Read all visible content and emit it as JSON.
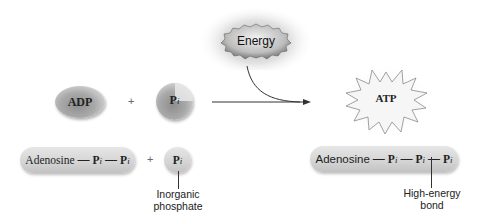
{
  "figure": {
    "energy_label": "Energy",
    "atp_label": "ATP",
    "adp_label": "ADP",
    "pi_symbol": "P",
    "pi_subscript": "i",
    "plus": "+",
    "bond_dash": "—",
    "adenosine": "Adenosine",
    "inorganic_phosphate_label_line1": "Inorganic",
    "inorganic_phosphate_label_line2": "phosphate",
    "high_energy_label_line1": "High-energy",
    "high_energy_label_line2": "bond"
  },
  "colors": {
    "background": "#ffffff",
    "shape_gray": "#bdbdbd",
    "text": "#222222",
    "arrow": "#333333"
  }
}
